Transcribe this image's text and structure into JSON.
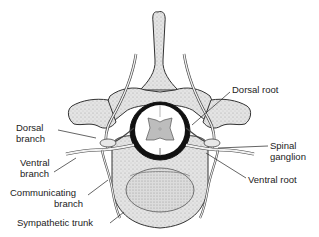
{
  "diagram": {
    "labels": {
      "dorsal_root": "Dorsal root",
      "dorsal_branch_1": "Dorsal",
      "dorsal_branch_2": "branch",
      "spinal_ganglion_1": "Spinal",
      "spinal_ganglion_2": "ganglion",
      "ventral_branch_1": "Ventral",
      "ventral_branch_2": "branch",
      "ventral_root": "Ventral root",
      "communicating_branch_1": "Communicating",
      "communicating_branch_2": "branch",
      "sympathetic_trunk": "Sympathetic trunk"
    },
    "colors": {
      "bone_fill": "#d9d9d9",
      "outline": "#333333",
      "grey_matter": "#bdbdbd",
      "dura": "#111111",
      "background": "#ffffff"
    }
  }
}
